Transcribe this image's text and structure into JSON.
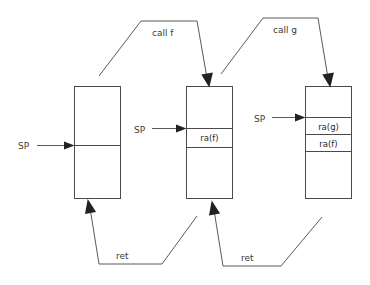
{
  "diagram": {
    "background_color": "#ffffff",
    "stroke_color": "#4a4a4a",
    "text_color": "#3a3a3a",
    "stacks": [
      {
        "id": "stack-1",
        "sp_label": "SP",
        "cells": [
          {
            "label": ""
          },
          {
            "label": ""
          }
        ]
      },
      {
        "id": "stack-2",
        "sp_label": "SP",
        "cells": [
          {
            "label": ""
          },
          {
            "label": "ra(f)"
          },
          {
            "label": ""
          }
        ]
      },
      {
        "id": "stack-3",
        "sp_label": "SP",
        "cells": [
          {
            "label": ""
          },
          {
            "label": "ra(g)"
          },
          {
            "label": "ra(f)"
          },
          {
            "label": ""
          }
        ]
      }
    ],
    "edges": [
      {
        "id": "call-f",
        "label": "call f"
      },
      {
        "id": "call-g",
        "label": "call g"
      },
      {
        "id": "ret-1",
        "label": "ret"
      },
      {
        "id": "ret-2",
        "label": "ret"
      }
    ]
  }
}
